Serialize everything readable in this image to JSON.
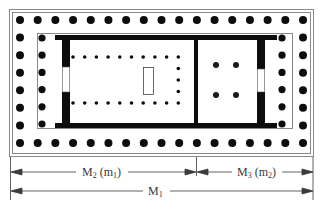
{
  "diagram": {
    "type": "temple-floor-plan",
    "colors": {
      "background": "#ffffff",
      "column": "#0d0d0d",
      "wall": "#0d0d0d",
      "frame_line": "#8a8a8a",
      "dimension_line": "#3a3a3a",
      "text": "#3a3a3a"
    },
    "peristyle": {
      "front_columns": 17,
      "side_columns": 8
    },
    "pronaos_columns": 6,
    "interior_colonnade": "U-shaped row of small columns around statue base",
    "opisthodomos_columns": 4,
    "dimensions": [
      {
        "id": "m2",
        "label_main": "M",
        "label_sub": "2",
        "label_paren_main": "m",
        "label_paren_sub": "1",
        "from": "left edge",
        "to": "dividing wall"
      },
      {
        "id": "m3",
        "label_main": "M",
        "label_sub": "3",
        "label_paren_main": "m",
        "label_paren_sub": "2",
        "from": "dividing wall",
        "to": "right edge"
      },
      {
        "id": "m1",
        "label_main": "M",
        "label_sub": "1",
        "from": "left edge",
        "to": "right edge"
      }
    ]
  }
}
